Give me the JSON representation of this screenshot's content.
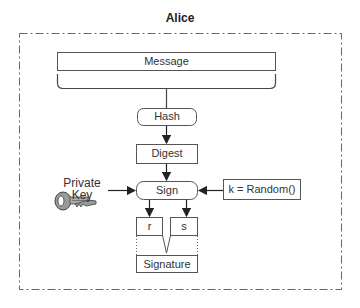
{
  "diagram": {
    "title": "Alice",
    "nodes": {
      "message": "Message",
      "hash": "Hash",
      "digest": "Digest",
      "sign": "Sign",
      "random": "k = Random()",
      "r": "r",
      "s": "s",
      "signature": "Signature",
      "private_key": "Private Key"
    },
    "icons": {
      "key": "key-icon"
    },
    "edges": [
      {
        "from": "message",
        "to": "hash"
      },
      {
        "from": "hash",
        "to": "digest"
      },
      {
        "from": "digest",
        "to": "sign"
      },
      {
        "from": "private_key",
        "to": "sign"
      },
      {
        "from": "random",
        "to": "sign"
      },
      {
        "from": "sign",
        "to": "r"
      },
      {
        "from": "sign",
        "to": "s"
      },
      {
        "from": "r",
        "to": "signature"
      },
      {
        "from": "s",
        "to": "signature"
      }
    ],
    "colors": {
      "stroke": "#555555",
      "background": "#ffffff"
    }
  }
}
